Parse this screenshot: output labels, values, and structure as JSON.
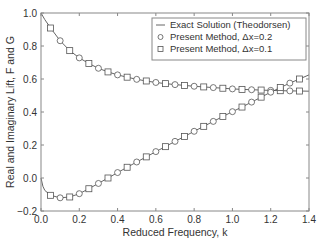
{
  "chart_data": {
    "type": "line",
    "title": "",
    "xlabel": "Reduced Frequency, k",
    "ylabel": "Real and Imaginary Lift, F and G",
    "xlim": [
      0.0,
      1.4
    ],
    "ylim": [
      -0.2,
      1.0
    ],
    "xticks": [
      "0.0",
      "0.2",
      "0.4",
      "0.6",
      "0.8",
      "1.0",
      "1.2",
      "1.4"
    ],
    "yticks": [
      "-0.2",
      "0.0",
      "0.2",
      "0.4",
      "0.6",
      "0.8",
      "1.0"
    ],
    "grid": false,
    "legend_position": "upper right",
    "legend": [
      "Exact Solution (Theodorsen)",
      "Present Method, Δx=0.2",
      "Present Method, Δx=0.1"
    ],
    "series": [
      {
        "name": "Exact Solution (Theodorsen) F",
        "style": "line",
        "x": [
          0.0,
          0.02,
          0.05,
          0.1,
          0.15,
          0.2,
          0.25,
          0.3,
          0.35,
          0.4,
          0.45,
          0.5,
          0.55,
          0.6,
          0.65,
          0.7,
          0.75,
          0.8,
          0.85,
          0.9,
          0.95,
          1.0,
          1.05,
          1.1,
          1.15,
          1.2,
          1.25,
          1.3,
          1.35,
          1.4
        ],
        "values": [
          1.0,
          0.96,
          0.909,
          0.832,
          0.772,
          0.728,
          0.694,
          0.665,
          0.643,
          0.625,
          0.611,
          0.598,
          0.588,
          0.579,
          0.572,
          0.566,
          0.561,
          0.556,
          0.552,
          0.548,
          0.544,
          0.54,
          0.537,
          0.535,
          0.533,
          0.531,
          0.529,
          0.528,
          0.527,
          0.526
        ]
      },
      {
        "name": "Exact Solution (Theodorsen) G",
        "style": "line",
        "x": [
          0.0,
          0.01,
          0.02,
          0.05,
          0.1,
          0.15,
          0.2,
          0.25,
          0.3,
          0.35,
          0.4,
          0.45,
          0.5,
          0.55,
          0.6,
          0.65,
          0.7,
          0.75,
          0.8,
          0.85,
          0.9,
          0.95,
          1.0,
          1.05,
          1.1,
          1.15,
          1.2,
          1.25,
          1.3,
          1.35,
          1.4
        ],
        "values": [
          0.0,
          -0.05,
          -0.075,
          -0.105,
          -0.12,
          -0.115,
          -0.095,
          -0.065,
          -0.033,
          0.0,
          0.033,
          0.065,
          0.097,
          0.128,
          0.16,
          0.19,
          0.222,
          0.252,
          0.283,
          0.313,
          0.343,
          0.373,
          0.402,
          0.43,
          0.46,
          0.49,
          0.52,
          0.548,
          0.575,
          0.6,
          0.625
        ]
      },
      {
        "name": "Present Method, Δx=0.2 F",
        "style": "circle",
        "x": [
          0.1,
          0.2,
          0.3,
          0.4,
          0.5,
          0.6,
          0.7,
          0.8,
          0.9,
          1.0,
          1.1,
          1.2,
          1.3
        ],
        "values": [
          0.832,
          0.728,
          0.665,
          0.625,
          0.598,
          0.579,
          0.566,
          0.556,
          0.548,
          0.54,
          0.535,
          0.531,
          0.528
        ]
      },
      {
        "name": "Present Method, Δx=0.2 G",
        "style": "circle",
        "x": [
          0.1,
          0.2,
          0.3,
          0.4,
          0.5,
          0.6,
          0.7,
          0.8,
          0.9,
          1.0,
          1.1,
          1.2,
          1.3
        ],
        "values": [
          -0.12,
          -0.095,
          -0.033,
          0.033,
          0.097,
          0.16,
          0.222,
          0.283,
          0.343,
          0.402,
          0.46,
          0.52,
          0.575
        ]
      },
      {
        "name": "Present Method, Δx=0.1 F",
        "style": "square",
        "x": [
          0.05,
          0.15,
          0.25,
          0.35,
          0.45,
          0.55,
          0.65,
          0.75,
          0.85,
          0.95,
          1.05,
          1.15,
          1.25,
          1.35
        ],
        "values": [
          0.909,
          0.772,
          0.694,
          0.643,
          0.611,
          0.588,
          0.572,
          0.561,
          0.552,
          0.544,
          0.537,
          0.533,
          0.529,
          0.527
        ]
      },
      {
        "name": "Present Method, Δx=0.1 G",
        "style": "square",
        "x": [
          0.05,
          0.15,
          0.25,
          0.35,
          0.45,
          0.55,
          0.65,
          0.75,
          0.85,
          0.95,
          1.05,
          1.15,
          1.25,
          1.35
        ],
        "values": [
          -0.105,
          -0.115,
          -0.065,
          0.0,
          0.065,
          0.128,
          0.19,
          0.252,
          0.313,
          0.373,
          0.43,
          0.49,
          0.548,
          0.6
        ]
      }
    ]
  }
}
